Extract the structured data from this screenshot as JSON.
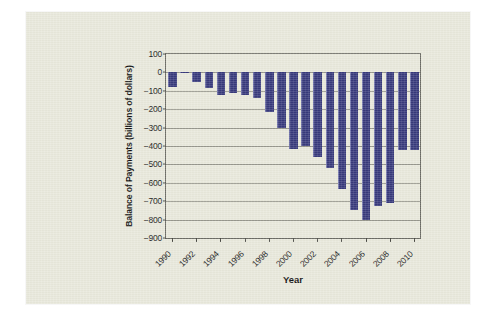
{
  "figure": {
    "background_color": "#e9e9dc",
    "page_color": "#ffffff"
  },
  "chart_data": {
    "type": "bar",
    "title": "",
    "xlabel": "Year",
    "ylabel": "Balance of Payments (billions of dollars)",
    "ylim": [
      -900,
      100
    ],
    "ytick_step": 100,
    "ytick_labels": [
      "100",
      "0",
      "−100",
      "−200",
      "−300",
      "−400",
      "−500",
      "−600",
      "−700",
      "−800",
      "−900"
    ],
    "ytick_values": [
      100,
      0,
      -100,
      -200,
      -300,
      -400,
      -500,
      -600,
      -700,
      -800,
      -900
    ],
    "xtick_labels": [
      "1990",
      "1992",
      "1994",
      "1996",
      "1998",
      "2000",
      "2002",
      "2004",
      "2006",
      "2008",
      "2010"
    ],
    "grid": true,
    "legend": false,
    "bar_color": "#383a7c",
    "categories": [
      "1990",
      "1991",
      "1992",
      "1993",
      "1994",
      "1995",
      "1996",
      "1997",
      "1998",
      "1999",
      "2000",
      "2001",
      "2002",
      "2003",
      "2004",
      "2005",
      "2006",
      "2007",
      "2008",
      "2009",
      "2010"
    ],
    "values": [
      -79,
      3,
      -51,
      -85,
      -122,
      -114,
      -125,
      -141,
      -215,
      -301,
      -417,
      -398,
      -459,
      -522,
      -635,
      -749,
      -804,
      -727,
      -710,
      -420,
      -420
    ],
    "series": [
      {
        "name": "Balance of Payments",
        "values": [
          -79,
          3,
          -51,
          -85,
          -122,
          -114,
          -125,
          -141,
          -215,
          -301,
          -417,
          -398,
          -459,
          -522,
          -635,
          -749,
          -804,
          -727,
          -710,
          -420,
          -420
        ]
      }
    ]
  }
}
